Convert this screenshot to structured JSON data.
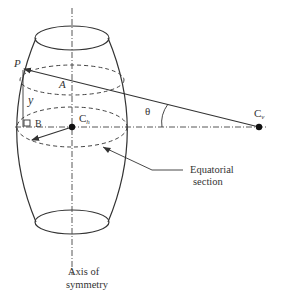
{
  "diagram": {
    "labels": {
      "point_p": "P",
      "point_a": "A",
      "height_y": "y",
      "point_b": "B",
      "center_h_main": "C",
      "center_h_sub": "h",
      "center_v_main": "C",
      "center_v_sub": "v",
      "angle_theta": "θ",
      "equatorial_line1": "Equatorial",
      "equatorial_line2": "section",
      "axis_line1": "Axis of",
      "axis_line2": "symmetry"
    },
    "colors": {
      "stroke": "#333333",
      "background": "#ffffff"
    }
  }
}
